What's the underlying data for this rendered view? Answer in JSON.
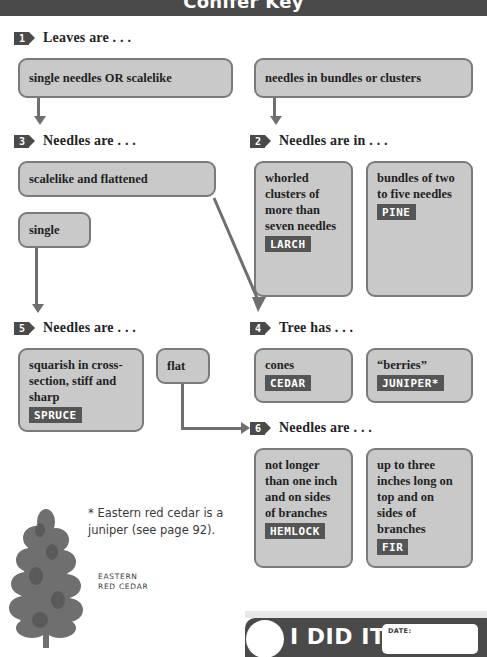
{
  "header": {
    "title": "Conifer Key"
  },
  "steps": {
    "s1": {
      "number": "1",
      "title": "Leaves are . . ."
    },
    "s2": {
      "number": "2",
      "title": "Needles are in . . ."
    },
    "s3": {
      "number": "3",
      "title": "Needles are  . . ."
    },
    "s4": {
      "number": "4",
      "title": "Tree has . . ."
    },
    "s5": {
      "number": "5",
      "title": "Needles are  . . ."
    },
    "s6": {
      "number": "6",
      "title": "Needles are  . . ."
    }
  },
  "boxes": {
    "single_needles": {
      "text": "single needles OR scalelike"
    },
    "bundles": {
      "text": "needles in bundles or clusters"
    },
    "scalelike_flat": {
      "text": "scalelike and flattened"
    },
    "single": {
      "text": "single"
    },
    "larch": {
      "text": "whorled clusters of more than seven needles",
      "chip": "LARCH"
    },
    "pine": {
      "text": "bundles of two to five needles",
      "chip": "PINE"
    },
    "spruce": {
      "text": "squarish in cross-section, stiff and sharp",
      "chip": "SPRUCE"
    },
    "flat": {
      "text": "flat"
    },
    "cedar": {
      "text": "cones",
      "chip": "CEDAR"
    },
    "juniper": {
      "text": "“berries”",
      "chip": "JUNIPER*"
    },
    "hemlock": {
      "text": "not longer than one inch and on sides of branches",
      "chip": "HEMLOCK"
    },
    "fir": {
      "text": "up to three inches long on top and on sides of branches",
      "chip": "FIR"
    }
  },
  "footnote": {
    "text": "* Eastern red cedar is a juniper (see page 92)."
  },
  "tree": {
    "caption_line1": "EASTERN",
    "caption_line2": "RED CEDAR"
  },
  "banner": {
    "label": "I DID IT!",
    "date_label": "DATE:"
  },
  "colors": {
    "dark": "#4a4a4a",
    "box_fill": "#c9c9c9",
    "box_border": "#7a7a7a",
    "chip": "#555555",
    "connector": "#6f6f6f"
  }
}
